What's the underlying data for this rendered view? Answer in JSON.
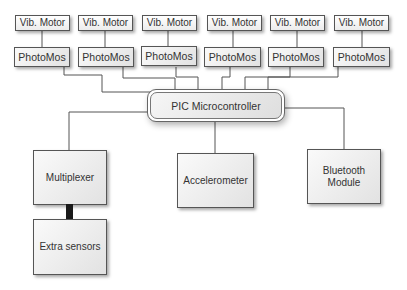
{
  "diagram": {
    "vib_motors": [
      {
        "label": "Vib. Motor"
      },
      {
        "label": "Vib. Motor"
      },
      {
        "label": "Vib. Motor"
      },
      {
        "label": "Vib. Motor"
      },
      {
        "label": "Vib. Motor"
      },
      {
        "label": "Vib. Motor"
      }
    ],
    "photomos": [
      {
        "label": "PhotoMos"
      },
      {
        "label": "PhotoMos"
      },
      {
        "label": "PhotoMos"
      },
      {
        "label": "PhotoMos"
      },
      {
        "label": "PhotoMos"
      },
      {
        "label": "PhotoMos"
      }
    ],
    "controller": {
      "label": "PIC Microcontroller"
    },
    "multiplexer": {
      "label": "Multiplexer"
    },
    "extra_sensors": {
      "label": "Extra sensors"
    },
    "accelerometer": {
      "label": "Accelerometer"
    },
    "bluetooth": {
      "label_line1": "Bluetooth",
      "label_line2": "Module"
    },
    "colors": {
      "wire": "#555555",
      "bus": "#1a1a1a",
      "box_border": "#555555"
    }
  }
}
